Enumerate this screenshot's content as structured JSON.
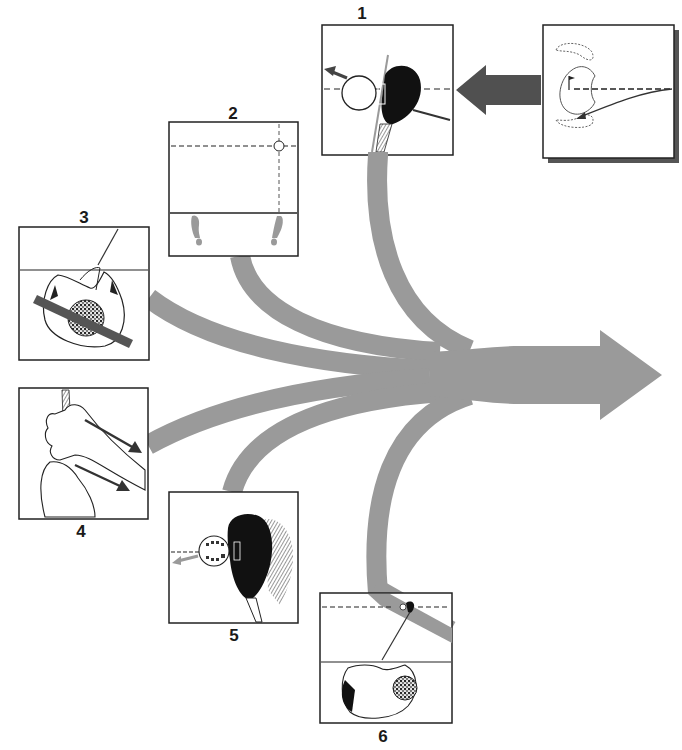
{
  "diagram": {
    "colors": {
      "background": "#ffffff",
      "flow_arrow": "#9a9a9a",
      "dark_arrow": "#505050",
      "outline": "#222222",
      "shadow": "#555555"
    },
    "panels": [
      {
        "number": "1",
        "subject": "clubface square at impact with ball"
      },
      {
        "number": "2",
        "subject": "stance alignment with feet and ball position"
      },
      {
        "number": "3",
        "subject": "overhead view of shoulder turn with bar"
      },
      {
        "number": "4",
        "subject": "grip with hands on club"
      },
      {
        "number": "5",
        "subject": "clubface with ball impact closeup"
      },
      {
        "number": "6",
        "subject": "overhead view of golfer at address"
      }
    ],
    "target_panel": {
      "subject": "green with flag and bunkers, shot path"
    }
  }
}
